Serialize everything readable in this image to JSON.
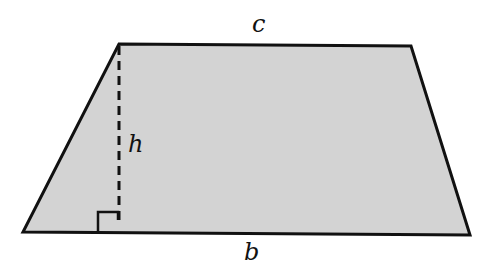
{
  "diagram": {
    "type": "trapezoid",
    "fill": "#d3d3d3",
    "stroke": "#111111",
    "labels": {
      "top": "c",
      "height": "h",
      "bottom": "b"
    },
    "vertices": {
      "top_left": [
        119,
        44
      ],
      "top_right": [
        411,
        46
      ],
      "bottom_right": [
        470,
        235
      ],
      "bottom_left": [
        23,
        232
      ]
    },
    "height_line": "dashed",
    "right_angle_marker": true
  }
}
